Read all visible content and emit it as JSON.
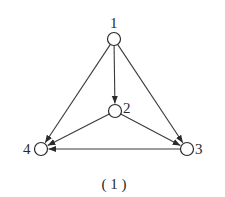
{
  "diagram": {
    "type": "directed-graph",
    "caption": "( 1 )",
    "nodes": [
      {
        "id": "1",
        "label": "1",
        "x": 114,
        "y": 39
      },
      {
        "id": "2",
        "label": "2",
        "x": 115,
        "y": 111
      },
      {
        "id": "3",
        "label": "3",
        "x": 187,
        "y": 149
      },
      {
        "id": "4",
        "label": "4",
        "x": 41,
        "y": 149
      }
    ],
    "edges": [
      {
        "from": "1",
        "to": "4"
      },
      {
        "from": "1",
        "to": "2"
      },
      {
        "from": "1",
        "to": "3"
      },
      {
        "from": "2",
        "to": "4"
      },
      {
        "from": "2",
        "to": "3"
      },
      {
        "from": "3",
        "to": "4"
      }
    ],
    "colors": {
      "stroke": "#2a2a2a",
      "background": "#ffffff"
    }
  }
}
